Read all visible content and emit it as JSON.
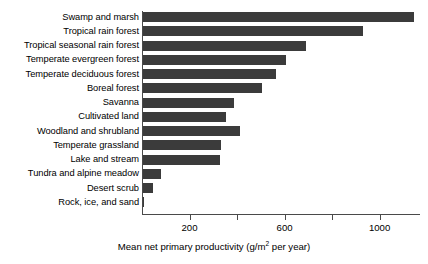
{
  "chart_data": {
    "type": "bar",
    "orientation": "horizontal",
    "title": "",
    "subtitle": "",
    "xlabel": "Mean net primary productivity (g/m2 per year)",
    "xlabel_parts": {
      "before": "Mean net primary productivity (g/m",
      "superscript": "2",
      "after": " per year)"
    },
    "ylabel": "",
    "categories": [
      "Swamp and marsh",
      "Tropical rain forest",
      "Tropical seasonal rain forest",
      "Temperate evergreen forest",
      "Temperate deciduous forest",
      "Boreal forest",
      "Savanna",
      "Cultivated land",
      "Woodland and shrubland",
      "Temperate grassland",
      "Lake and stream",
      "Tundra and alpine meadow",
      "Desert scrub",
      "Rock, ice, and sand"
    ],
    "values": [
      1140,
      925,
      685,
      600,
      560,
      500,
      385,
      350,
      410,
      330,
      325,
      75,
      40,
      3
    ],
    "xlim": [
      0,
      1170
    ],
    "ticks": [
      200,
      400,
      600,
      800,
      1000
    ],
    "tick_labels": [
      {
        "value": 200,
        "label": "200"
      },
      {
        "value": 400,
        "label": ""
      },
      {
        "value": 600,
        "label": "600"
      },
      {
        "value": 800,
        "label": ""
      },
      {
        "value": 1000,
        "label": "1000"
      }
    ],
    "grid": false,
    "legend": false,
    "bar_color": "#3b3b3b",
    "axis_color": "#4a4a4a",
    "background_color": "#ffffff"
  }
}
